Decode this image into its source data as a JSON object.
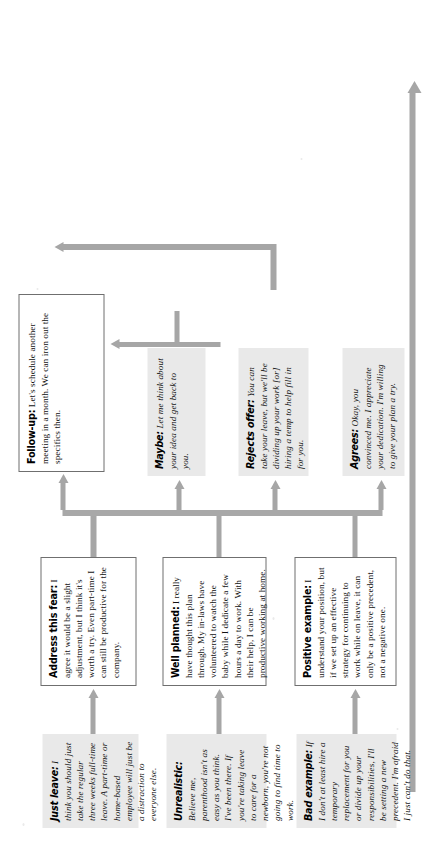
{
  "diagram": {
    "type": "flowchart",
    "orientation": "rotated-90-ccw",
    "columns": [
      {
        "id": "objections",
        "style": "gray",
        "nodes": [
          {
            "id": "bad-example",
            "lead": "Bad example:",
            "body": "If I don't at least hire a temporary replacement for you or divide up your responsibilities, I'll be setting a new precedent. I'm afraid I just can't do that."
          },
          {
            "id": "unrealistic",
            "lead": "Unrealistic:",
            "body": "Believe me, parenthood isn't as easy as you think. I've been there. If you're taking leave to care for a newborn, you're not going to find time to work."
          },
          {
            "id": "just-leave",
            "lead": "Just leave:",
            "body": "I think you should just take the regular three weeks full-time leave. A part-time or home-based employee will just be a distraction to everyone else."
          }
        ]
      },
      {
        "id": "responses",
        "style": "white",
        "nodes": [
          {
            "id": "positive-example",
            "lead": "Positive example:",
            "body": "I understand your position, but if we set up an effective strategy for continuing to work while on leave, it can only be a positive precedent, not a negative one."
          },
          {
            "id": "well-planned",
            "lead": "Well planned:",
            "body": "I really have thought this plan through. My in-laws have volunteered to watch the baby while I dedicate a few hours a day to work. With their help, I can be productive working at home."
          },
          {
            "id": "address-this-fear",
            "lead": "Address this fear:",
            "body": "I agree it would be a slight adjustment, but I think it's worth a try. Even part-time I can still be productive for the company."
          }
        ]
      },
      {
        "id": "outcomes",
        "style": "gray",
        "nodes": [
          {
            "id": "agrees",
            "lead": "Agrees:",
            "body": "Okay, you convinced me. I appreciate your dedication. I'm willing to give your plan a try."
          },
          {
            "id": "rejects-offer",
            "lead": "Rejects offer:",
            "body": "You can take your leave, but we'll be dividing up your work [or] hiring a temp to help fill in for you."
          },
          {
            "id": "maybe",
            "lead": "Maybe:",
            "body": "Let me think about your idea and get back to you."
          }
        ]
      },
      {
        "id": "closing",
        "style": "white",
        "nodes": [
          {
            "id": "follow-up",
            "lead": "Follow-up:",
            "body": "Let's schedule another meeting in a month. We can iron out the specifics then."
          }
        ]
      }
    ],
    "colors": {
      "node_fill_gray": "#e9e9e9",
      "node_fill_white": "#ffffff",
      "node_border": "#6f6f6f",
      "arrow": "#a6a6a6",
      "text": "#111111",
      "page": "#ffffff"
    },
    "edges": [
      {
        "from": "bad-example",
        "to": "positive-example"
      },
      {
        "from": "unrealistic",
        "to": "well-planned"
      },
      {
        "from": "just-leave",
        "to": "address-this-fear"
      },
      {
        "from": "responses-trunk",
        "to": "agrees"
      },
      {
        "from": "responses-trunk",
        "to": "rejects-offer"
      },
      {
        "from": "responses-trunk",
        "to": "maybe"
      },
      {
        "from": "maybe",
        "to": "follow-up"
      },
      {
        "from": "responses-trunk",
        "to": "follow-up"
      },
      {
        "from": "agrees",
        "to": "feedback-loop"
      }
    ]
  }
}
